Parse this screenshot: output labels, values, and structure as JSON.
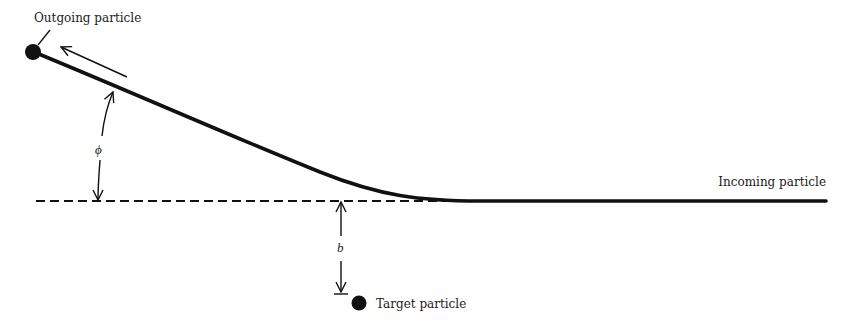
{
  "diagram": {
    "type": "scattering-trajectory",
    "labels": {
      "outgoing": "Outgoing particle",
      "incoming": "Incoming particle",
      "target": "Target particle",
      "angle_symbol": "ϕ",
      "impact_symbol": "b"
    },
    "colors": {
      "ink": "#111111",
      "background": "#ffffff"
    }
  }
}
